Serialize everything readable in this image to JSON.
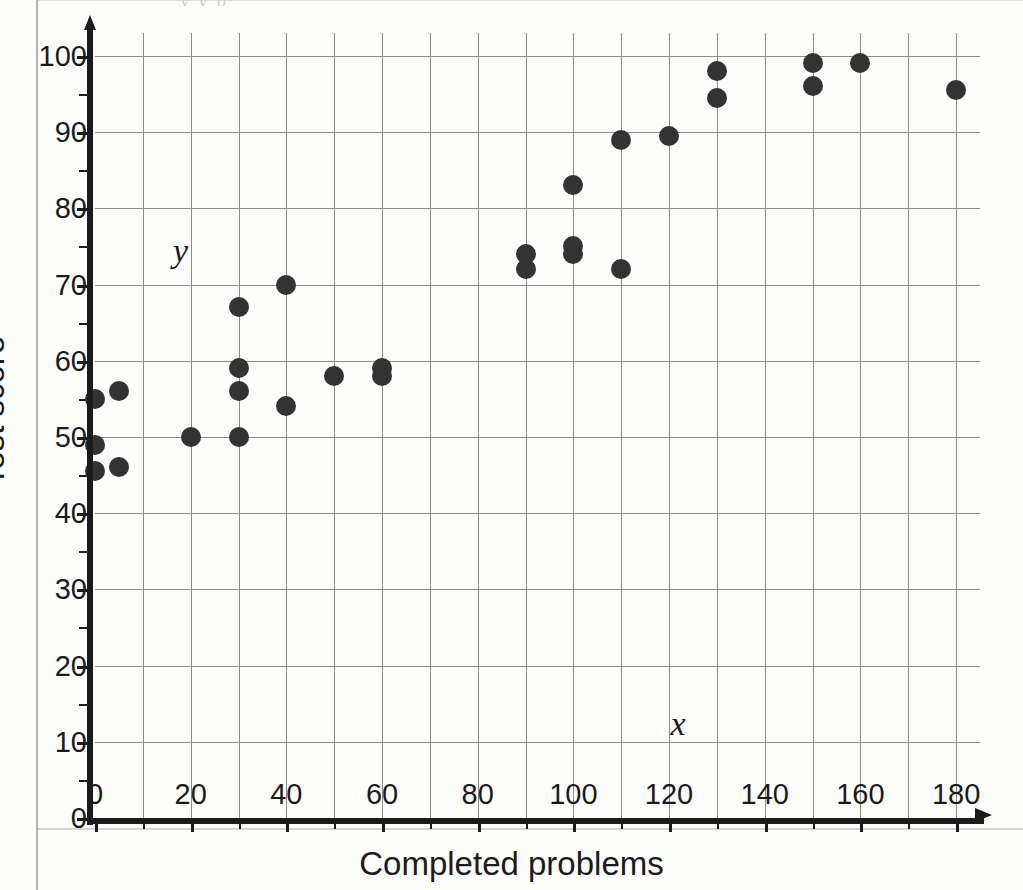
{
  "page": {
    "top_cut_text": "y y p"
  },
  "chart_data": {
    "type": "scatter",
    "title": "",
    "xlabel": "Completed problems",
    "ylabel": "Test score",
    "x_var_label": "x",
    "y_var_label": "y",
    "xlim": [
      0,
      185
    ],
    "ylim": [
      0,
      103
    ],
    "x_ticks": [
      0,
      20,
      40,
      60,
      80,
      100,
      120,
      140,
      160,
      180
    ],
    "x_tick_labels": [
      "0",
      "20",
      "40",
      "60",
      "80",
      "100",
      "120",
      "140",
      "160",
      "180"
    ],
    "x_minor_step": 10,
    "y_ticks": [
      0,
      10,
      20,
      30,
      40,
      50,
      60,
      70,
      80,
      90,
      100
    ],
    "y_tick_labels": [
      "0",
      "10",
      "20",
      "30",
      "40",
      "50",
      "60",
      "70",
      "80",
      "90",
      "100"
    ],
    "y_minor_step": 5,
    "grid": true,
    "legend": false,
    "marker_color": "#333333",
    "points": [
      {
        "x": 0,
        "y": 55
      },
      {
        "x": 0,
        "y": 49
      },
      {
        "x": 0,
        "y": 45.5
      },
      {
        "x": 5,
        "y": 56
      },
      {
        "x": 5,
        "y": 46
      },
      {
        "x": 20,
        "y": 50
      },
      {
        "x": 30,
        "y": 67
      },
      {
        "x": 30,
        "y": 59
      },
      {
        "x": 30,
        "y": 56
      },
      {
        "x": 30,
        "y": 50
      },
      {
        "x": 40,
        "y": 70
      },
      {
        "x": 40,
        "y": 54
      },
      {
        "x": 50,
        "y": 58
      },
      {
        "x": 60,
        "y": 59
      },
      {
        "x": 60,
        "y": 58
      },
      {
        "x": 90,
        "y": 74
      },
      {
        "x": 90,
        "y": 72
      },
      {
        "x": 100,
        "y": 83
      },
      {
        "x": 100,
        "y": 75
      },
      {
        "x": 100,
        "y": 74
      },
      {
        "x": 110,
        "y": 89
      },
      {
        "x": 110,
        "y": 72
      },
      {
        "x": 120,
        "y": 89.5
      },
      {
        "x": 130,
        "y": 98
      },
      {
        "x": 130,
        "y": 94.5
      },
      {
        "x": 150,
        "y": 99
      },
      {
        "x": 150,
        "y": 96
      },
      {
        "x": 160,
        "y": 99
      },
      {
        "x": 180,
        "y": 95.5
      }
    ]
  }
}
